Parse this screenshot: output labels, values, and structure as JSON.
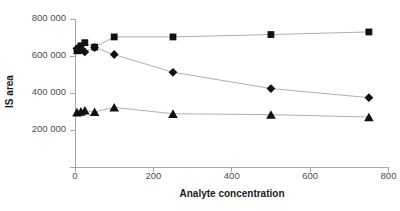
{
  "chart_data": {
    "type": "scatter",
    "title": "",
    "xlabel": "Analyte concentration",
    "ylabel": "IS area",
    "xlim": [
      0,
      800
    ],
    "ylim": [
      0,
      800000
    ],
    "xticks": [
      "0",
      "200",
      "400",
      "600",
      "800"
    ],
    "xtick_values": [
      0,
      200,
      400,
      600,
      800
    ],
    "yticks": [
      "",
      "200 000",
      "400 000",
      "600 000",
      "800 000"
    ],
    "ytick_values": [
      0,
      200000,
      400000,
      600000,
      800000
    ],
    "grid": false,
    "legend": "none",
    "series": [
      {
        "name": "IS area (square marker series)",
        "marker": "square",
        "color": "#111111",
        "points": [
          {
            "x": 5,
            "y": 628000
          },
          {
            "x": 10,
            "y": 640000
          },
          {
            "x": 15,
            "y": 655000
          },
          {
            "x": 25,
            "y": 672000
          },
          {
            "x": 50,
            "y": 648000
          },
          {
            "x": 100,
            "y": 703000
          },
          {
            "x": 250,
            "y": 703000
          },
          {
            "x": 500,
            "y": 716000
          },
          {
            "x": 750,
            "y": 730000
          }
        ]
      },
      {
        "name": "IS area (diamond marker series)",
        "marker": "diamond",
        "color": "#111111",
        "points": [
          {
            "x": 5,
            "y": 640000
          },
          {
            "x": 10,
            "y": 645000
          },
          {
            "x": 15,
            "y": 632000
          },
          {
            "x": 25,
            "y": 622000
          },
          {
            "x": 50,
            "y": 646000
          },
          {
            "x": 100,
            "y": 608000
          },
          {
            "x": 250,
            "y": 512000
          },
          {
            "x": 500,
            "y": 424000
          },
          {
            "x": 750,
            "y": 375000
          }
        ]
      },
      {
        "name": "IS area (triangle marker series)",
        "marker": "triangle",
        "color": "#111111",
        "points": [
          {
            "x": 5,
            "y": 296000
          },
          {
            "x": 15,
            "y": 300000
          },
          {
            "x": 25,
            "y": 306000
          },
          {
            "x": 50,
            "y": 298000
          },
          {
            "x": 100,
            "y": 322000
          },
          {
            "x": 250,
            "y": 288000
          },
          {
            "x": 500,
            "y": 283000
          },
          {
            "x": 750,
            "y": 270000
          }
        ]
      }
    ]
  },
  "axes": {
    "x_title": "Analyte concentration",
    "y_title": "IS area",
    "x_tick_labels": [
      "0",
      "200",
      "400",
      "600",
      "800"
    ],
    "y_tick_labels": [
      "800 000",
      "600 000",
      "400 000",
      "200 000"
    ]
  },
  "colors": {
    "marker": "#111111",
    "line": "#9a9a9a",
    "axis": "#a6a6a6",
    "tick_text": "#4d4d4d",
    "title_text": "#1a1a1a",
    "background": "#ffffff"
  }
}
